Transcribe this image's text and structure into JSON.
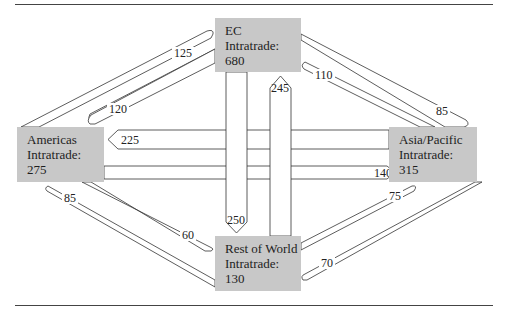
{
  "diagram": {
    "type": "flow-diagram",
    "nodes": [
      {
        "id": "ec",
        "name": "EC",
        "intratrade_label": "Intratrade:",
        "intratrade_value": "680"
      },
      {
        "id": "americas",
        "name": "Americas",
        "intratrade_label": "Intratrade:",
        "intratrade_value": "275"
      },
      {
        "id": "asia_pacific",
        "name": "Asia/Pacific",
        "intratrade_label": "Intratrade:",
        "intratrade_value": "315"
      },
      {
        "id": "rest_of_world",
        "name": "Rest of World",
        "intratrade_label": "Intratrade:",
        "intratrade_value": "130"
      }
    ],
    "flows": [
      {
        "from": "americas",
        "to": "ec",
        "value": "125"
      },
      {
        "from": "ec",
        "to": "americas",
        "value": "120"
      },
      {
        "from": "asia_pacific",
        "to": "ec",
        "value": "110"
      },
      {
        "from": "ec",
        "to": "asia_pacific",
        "value": "85"
      },
      {
        "from": "asia_pacific",
        "to": "americas",
        "value": "225"
      },
      {
        "from": "americas",
        "to": "asia_pacific",
        "value": "140"
      },
      {
        "from": "ec",
        "to": "rest_of_world",
        "value": "250"
      },
      {
        "from": "rest_of_world",
        "to": "ec",
        "value": "245"
      },
      {
        "from": "rest_of_world",
        "to": "americas",
        "value": "85"
      },
      {
        "from": "americas",
        "to": "rest_of_world",
        "value": "60"
      },
      {
        "from": "rest_of_world",
        "to": "asia_pacific",
        "value": "75"
      },
      {
        "from": "asia_pacific",
        "to": "rest_of_world",
        "value": "70"
      }
    ]
  }
}
